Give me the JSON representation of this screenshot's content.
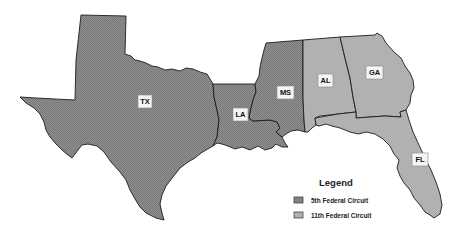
{
  "map": {
    "states": [
      {
        "abbr": "TX",
        "circuit": "5th"
      },
      {
        "abbr": "LA",
        "circuit": "5th"
      },
      {
        "abbr": "MS",
        "circuit": "5th"
      },
      {
        "abbr": "AL",
        "circuit": "11th"
      },
      {
        "abbr": "GA",
        "circuit": "11th"
      },
      {
        "abbr": "FL",
        "circuit": "11th"
      }
    ],
    "colors": {
      "fifth_circuit": "#8a8a8a",
      "eleventh_circuit": "#b4b4b4",
      "border": "#1c1c1c",
      "background": "#ffffff"
    }
  },
  "legend": {
    "title": "Legend",
    "items": [
      {
        "label": "5th Federal Circuit",
        "color": "#8a8a8a"
      },
      {
        "label": "11th Federal Circuit",
        "color": "#b4b4b4"
      }
    ]
  }
}
